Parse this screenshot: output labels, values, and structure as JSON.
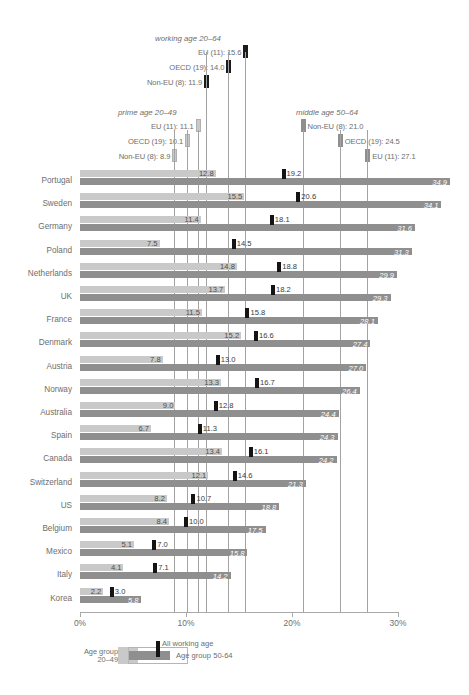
{
  "chart_data": {
    "type": "bar",
    "title": "",
    "xlabel": "",
    "ylabel": "",
    "xlim": [
      0,
      30
    ],
    "x_tick_labels": [
      "0%",
      "10%",
      "20%",
      "30%"
    ],
    "x_ticks": [
      0,
      10,
      20,
      30
    ],
    "grid": true,
    "legend_position": "bottom-left",
    "categories": [
      "Portugal",
      "Sweden",
      "Germany",
      "Poland",
      "Netherlands",
      "UK",
      "France",
      "Denmark",
      "Austria",
      "Norway",
      "Australia",
      "Spain",
      "Canada",
      "Switzerland",
      "US",
      "Belgium",
      "Mexico",
      "Italy",
      "Korea"
    ],
    "series": [
      {
        "name": "Age group 20-49",
        "color": "#c9c9c9",
        "values": [
          12.8,
          15.5,
          11.4,
          7.5,
          14.8,
          13.7,
          11.5,
          15.2,
          7.8,
          13.3,
          9.0,
          6.7,
          13.4,
          12.1,
          8.2,
          8.4,
          5.1,
          4.1,
          2.2
        ]
      },
      {
        "name": "All working age",
        "color": "#141414",
        "values": [
          19.2,
          20.6,
          18.1,
          14.5,
          18.8,
          18.2,
          15.8,
          16.6,
          13.0,
          16.7,
          12.8,
          11.3,
          16.1,
          14.6,
          10.7,
          10.0,
          7.0,
          7.1,
          3.0
        ]
      },
      {
        "name": "Age group 50-64",
        "color": "#8f8f8f",
        "values": [
          34.9,
          34.1,
          31.6,
          31.3,
          29.9,
          29.3,
          28.1,
          27.4,
          27.0,
          26.4,
          24.4,
          24.3,
          24.2,
          21.3,
          18.8,
          17.5,
          15.8,
          14.2,
          5.8
        ]
      }
    ],
    "annotations": {
      "working_age": {
        "title": "working age 20–64",
        "type": "All working age",
        "items": [
          {
            "label": "EU (11): 15.6",
            "value": 15.6
          },
          {
            "label": "OECD (19): 14.0",
            "value": 14.0
          },
          {
            "label": "Non-EU (8): 11.9",
            "value": 11.9
          }
        ]
      },
      "prime_age": {
        "title": "prime age 20–49",
        "type": "Age group 20-49",
        "items": [
          {
            "label": "EU (11): 11.1",
            "value": 11.1
          },
          {
            "label": "OECD (19): 10.1",
            "value": 10.1
          },
          {
            "label": "Non-EU (8): 8.9",
            "value": 8.9
          }
        ]
      },
      "middle_age": {
        "title": "middle age 50–64",
        "type": "Age group 50-64",
        "items": [
          {
            "label": "Non-EU (8): 21.0",
            "value": 21.0
          },
          {
            "label": "OECD (19): 24.5",
            "value": 24.5
          },
          {
            "label": "EU (11): 27.1",
            "value": 27.1
          }
        ]
      }
    }
  },
  "legend": {
    "prime_label_line1": "Age group",
    "prime_label_line2": "20–49",
    "working_label": "All working age",
    "middle_label": "Age group 50-64"
  },
  "colors": {
    "prime": "#c9c9c9",
    "working": "#141414",
    "middle": "#8f8f8f",
    "axis": "#a9a9a9",
    "text": "#6e6e6e"
  }
}
